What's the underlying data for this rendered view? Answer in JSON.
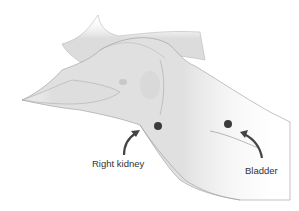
{
  "figure": {
    "labels": [
      {
        "id": "right-kidney",
        "text": "Right kidney",
        "x": 92,
        "y": 158
      },
      {
        "id": "bladder",
        "text": "Bladder",
        "x": 245,
        "y": 165
      }
    ],
    "markers": [
      {
        "id": "right-kidney-marker",
        "cx": 158,
        "cy": 126
      },
      {
        "id": "bladder-marker",
        "cx": 228,
        "cy": 124
      }
    ],
    "colors": {
      "skin": "#e2e2e2",
      "skin_shadow": "#cfcfcf",
      "outline": "#8a8a8a",
      "marker": "#3a3a3a",
      "arrow": "#444444",
      "text": "#333333"
    }
  }
}
